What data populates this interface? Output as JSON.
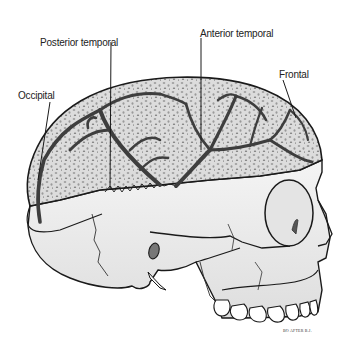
{
  "figure": {
    "labels": [
      {
        "id": "posterior-temporal",
        "text": "Posterior temporal",
        "x": 40,
        "y": 37
      },
      {
        "id": "anterior-temporal",
        "text": "Anterior temporal",
        "x": 200,
        "y": 28
      },
      {
        "id": "frontal",
        "text": "Frontal",
        "x": 279,
        "y": 69
      },
      {
        "id": "occipital",
        "text": "Occipital",
        "x": 18,
        "y": 90
      }
    ],
    "signature": "BO AFTER B.J.",
    "colors": {
      "background": "#ffffff",
      "outline": "#1a1a1a",
      "dura": "#d8d8d8",
      "vessel": "#4a4a4a",
      "bone": "#efefef",
      "bone_shade": "#d6d6d6"
    }
  }
}
